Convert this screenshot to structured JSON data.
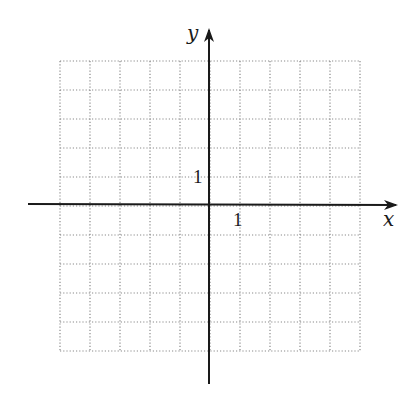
{
  "diagram": {
    "type": "coordinate-grid",
    "axes": {
      "x_label": "x",
      "y_label": "y",
      "x_unit_tick_label": "1",
      "y_unit_tick_label": "1",
      "color": "#1a1a1a"
    },
    "grid": {
      "x_range": [
        -5,
        5
      ],
      "y_range": [
        -5,
        5
      ],
      "cells_x": 10,
      "cells_y": 10,
      "style": "dotted",
      "color": "#8a8a8a"
    }
  },
  "chart_data": {
    "type": "scatter",
    "title": "",
    "xlabel": "x",
    "ylabel": "y",
    "xlim": [
      -5,
      5
    ],
    "ylim": [
      -5,
      5
    ],
    "grid": true,
    "tick_labels": {
      "x": [
        "1"
      ],
      "y": [
        "1"
      ]
    },
    "series": []
  }
}
